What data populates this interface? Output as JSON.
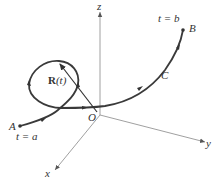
{
  "figure": {
    "type": "space curve with position vector",
    "labels": {
      "z_axis": "z",
      "y_axis": "y",
      "x_axis": "x",
      "origin": "O",
      "start_point": "A",
      "start_param": "t = a",
      "end_point": "B",
      "end_param": "t = b",
      "curve": "C",
      "vector_bold": "R",
      "vector_arg": "(t)"
    },
    "colors": {
      "axis": "#777777",
      "curve": "#3a3a3a",
      "text": "#333333"
    }
  }
}
